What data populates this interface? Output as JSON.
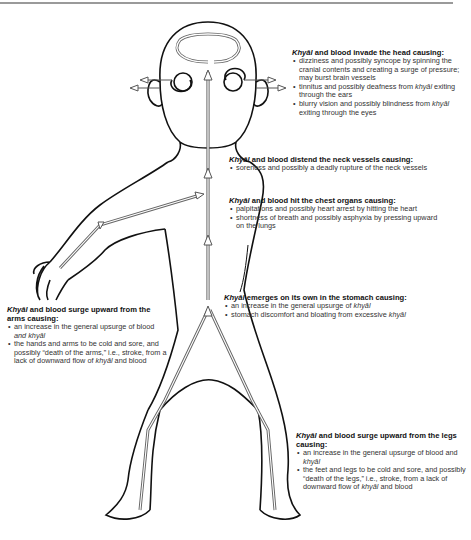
{
  "term": "Khyāl",
  "term_lower": "khyāl",
  "annotations": {
    "head": {
      "title_rest": " and blood invade the head causing:",
      "bullets": [
        {
          "pre": "dizziness and possibly syncope by spinning the cranial contents and creating a surge of pressure; may burst brain vessels"
        },
        {
          "pre": "tinnitus and possibly deafness from ",
          "post": " exiting through the ears"
        },
        {
          "pre": "blurry vision and possibly blindness from ",
          "post": " exiting through the eyes"
        }
      ]
    },
    "neck": {
      "title_rest": " and blood distend the neck vessels causing:",
      "bullets": [
        {
          "pre": "soreness and possibly a deadly rupture of the neck vessels"
        }
      ]
    },
    "chest": {
      "title_rest": " and blood hit the chest organs causing:",
      "bullets": [
        {
          "pre": "palpitations and possibly heart arrest by hitting the heart"
        },
        {
          "pre": "shortness of breath and possibly asphyxia by pressing upward on the lungs"
        }
      ]
    },
    "stomach": {
      "title_rest": " emerges on its own in the stomach causing:",
      "bullets": [
        {
          "pre": "an increase in the general upsurge of "
        },
        {
          "pre": "stomach discomfort and bloating from excessive "
        }
      ]
    },
    "arms": {
      "title_rest": " and blood surge upward from the arms causing:",
      "bullets": [
        {
          "pre": "an increase in the general upsurge of blood ",
          "mid_italic": "and khyāl"
        },
        {
          "pre": "the hands and arms to be cold and sore, and possibly “death of the arms,” i.e., stroke, from a lack of downward flow of ",
          "post": " and blood"
        }
      ]
    },
    "legs": {
      "title_rest": " and blood surge upward from the legs causing:",
      "bullets": [
        {
          "pre": "an increase in the general upsurge of blood and "
        },
        {
          "pre": "the feet and legs to be cold and sore, and possibly “death of the legs,” i.e., stroke, from a lack of downward flow of ",
          "post": " and blood"
        }
      ]
    }
  },
  "colors": {
    "outline": "#111111",
    "arrow_stroke": "#555555",
    "arrow_fill": "#ffffff",
    "text": "#333333",
    "rule": "#9a9a9a"
  }
}
